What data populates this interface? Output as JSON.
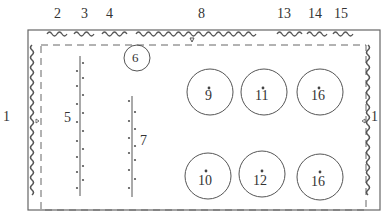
{
  "diagram": {
    "type": "plan-layout",
    "labels": {
      "left": "1",
      "right": "1",
      "top": [
        "2",
        "3",
        "4",
        "8",
        "13",
        "14",
        "15"
      ],
      "line5": "5",
      "line7": "7",
      "small_circle": "6"
    },
    "circles": [
      {
        "label": "9",
        "row": 1,
        "col": 1
      },
      {
        "label": "11",
        "row": 1,
        "col": 2
      },
      {
        "label": "16",
        "row": 1,
        "col": 3
      },
      {
        "label": "10",
        "row": 2,
        "col": 1
      },
      {
        "label": "12",
        "row": 2,
        "col": 2
      },
      {
        "label": "16",
        "row": 2,
        "col": 3
      }
    ],
    "colors": {
      "stroke": "#555555",
      "text": "#333333",
      "background": "#ffffff"
    }
  }
}
